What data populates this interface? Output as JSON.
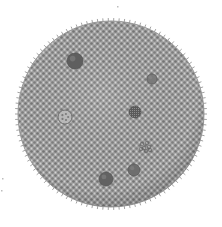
{
  "image": {
    "subject": "Volvox colony illustration",
    "background_color": "#ffffff",
    "colony": {
      "center": [
        111,
        114
      ],
      "radius": 93,
      "fill_color": "#a9a9a9",
      "cell_color": "#7d7d7d",
      "cell_highlight": "#d2d2d2",
      "spine_color": "#8a8a8a"
    },
    "daughter_colonies": [
      {
        "name": "daughter-colony-large",
        "cx": 75,
        "cy": 61,
        "r": 8,
        "style": "dark",
        "color": "#5f5f5f"
      },
      {
        "name": "daughter-colony-small",
        "cx": 152,
        "cy": 79,
        "r": 5,
        "style": "dark",
        "color": "#7a7a7a"
      },
      {
        "name": "daughter-colony-textured",
        "cx": 135,
        "cy": 112,
        "r": 6,
        "style": "textured",
        "color": "#6a6a6a"
      },
      {
        "name": "daughter-colony-ringed",
        "cx": 65,
        "cy": 117,
        "r": 7,
        "style": "ring",
        "color": "#8a8a8a"
      },
      {
        "name": "daughter-colony-cluster",
        "cx": 145,
        "cy": 146,
        "r": 7,
        "style": "cluster",
        "color": "#7a7a7a"
      },
      {
        "name": "daughter-colony-bottom-left",
        "cx": 106,
        "cy": 179,
        "r": 7,
        "style": "dark",
        "color": "#626262"
      },
      {
        "name": "daughter-colony-bottom-right",
        "cx": 134,
        "cy": 170,
        "r": 6,
        "style": "dark",
        "color": "#6e6e6e"
      }
    ],
    "specks": [
      {
        "x": 117,
        "y": 6
      },
      {
        "x": 2,
        "y": 178
      },
      {
        "x": 1,
        "y": 190
      }
    ]
  }
}
